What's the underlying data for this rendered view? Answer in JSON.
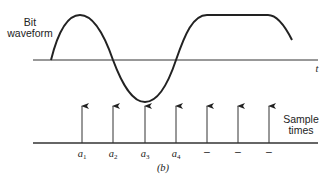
{
  "figure": {
    "panel_label": "(b)",
    "waveform_label_line1": "Bit",
    "waveform_label_line2": "waveform",
    "time_axis_label": "t",
    "sample_label_line1": "Sample",
    "sample_label_line2": "times",
    "sample_points": [
      {
        "name": "a",
        "sub": "1"
      },
      {
        "name": "a",
        "sub": "2"
      },
      {
        "name": "a",
        "sub": "3"
      },
      {
        "name": "a",
        "sub": "4"
      },
      {
        "name": "–",
        "sub": ""
      },
      {
        "name": "–",
        "sub": ""
      },
      {
        "name": "–",
        "sub": ""
      }
    ]
  },
  "colors": {
    "stroke": "#222222",
    "background": "#ffffff"
  }
}
